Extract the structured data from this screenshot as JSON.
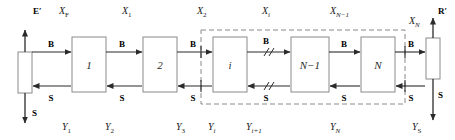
{
  "diagram": {
    "terminals": {
      "left": {
        "top_label": "E′",
        "bottom_label": "S",
        "name": "extract-terminal"
      },
      "right": {
        "top_label": "R′",
        "bottom_label": "S",
        "name": "raffinate-terminal"
      }
    },
    "stages": [
      {
        "id": "stage-1",
        "label": "1",
        "x": 72,
        "y": 37,
        "w": 34,
        "h": 55
      },
      {
        "id": "stage-2",
        "label": "2",
        "x": 143,
        "y": 37,
        "w": 34,
        "h": 55
      },
      {
        "id": "stage-i",
        "label": "i",
        "x": 213,
        "y": 37,
        "w": 34,
        "h": 55
      },
      {
        "id": "stage-n-minus-1",
        "label": "N−1",
        "x": 291,
        "y": 37,
        "w": 38,
        "h": 55
      },
      {
        "id": "stage-n",
        "label": "N",
        "x": 361,
        "y": 37,
        "w": 34,
        "h": 55
      }
    ],
    "top_labels": [
      {
        "name": "x-label-f",
        "base": "X",
        "sub": "F",
        "sub_italic": false,
        "x": 59,
        "y": 14
      },
      {
        "name": "x-label-1",
        "base": "X",
        "sub": "1",
        "sub_italic": false,
        "x": 122,
        "y": 14
      },
      {
        "name": "x-label-2",
        "base": "X",
        "sub": "2",
        "sub_italic": false,
        "x": 197,
        "y": 14
      },
      {
        "name": "x-label-i",
        "base": "X",
        "sub": "i",
        "sub_italic": true,
        "x": 262,
        "y": 14
      },
      {
        "name": "x-label-n-minus-1",
        "base": "X",
        "sub": "N−1",
        "sub_italic": true,
        "x": 330,
        "y": 14
      },
      {
        "name": "x-label-n",
        "base": "X",
        "sub": "N",
        "sub_italic": true,
        "x": 411,
        "y": 22
      }
    ],
    "bottom_labels": [
      {
        "name": "y-label-1",
        "base": "Y",
        "sub": "1",
        "sub_italic": false,
        "x": 62,
        "y": 130
      },
      {
        "name": "y-label-2",
        "base": "Y",
        "sub": "2",
        "sub_italic": false,
        "x": 105,
        "y": 130
      },
      {
        "name": "y-label-3",
        "base": "Y",
        "sub": "3",
        "sub_italic": false,
        "x": 176,
        "y": 130
      },
      {
        "name": "y-label-i",
        "base": "Y",
        "sub": "i",
        "sub_italic": true,
        "x": 208,
        "y": 130
      },
      {
        "name": "y-label-i-plus-1",
        "base": "Y",
        "sub": "i+1",
        "sub_italic": true,
        "x": 248,
        "y": 130
      },
      {
        "name": "y-label-n",
        "base": "Y",
        "sub": "N",
        "sub_italic": true,
        "x": 330,
        "y": 130
      },
      {
        "name": "y-label-s",
        "base": "Y",
        "sub": "S",
        "sub_italic": false,
        "x": 414,
        "y": 130
      }
    ],
    "stream_labels": {
      "top_stream": "B",
      "bottom_stream": "S",
      "b_positions": [
        {
          "name": "b-label-feed",
          "x": 51,
          "y": 44
        },
        {
          "name": "b-label-1",
          "x": 120,
          "y": 44
        },
        {
          "name": "b-label-2",
          "x": 190,
          "y": 44
        },
        {
          "name": "b-label-i",
          "x": 265,
          "y": 44
        },
        {
          "name": "b-label-n-minus-1",
          "x": 340,
          "y": 44
        },
        {
          "name": "b-label-n",
          "x": 411,
          "y": 44
        }
      ],
      "s_positions": [
        {
          "name": "s-label-1",
          "x": 51,
          "y": 96
        },
        {
          "name": "s-label-2",
          "x": 120,
          "y": 96
        },
        {
          "name": "s-label-3",
          "x": 190,
          "y": 96
        },
        {
          "name": "s-label-i",
          "x": 265,
          "y": 96
        },
        {
          "name": "s-label-n-minus-1",
          "x": 340,
          "y": 96
        },
        {
          "name": "s-label-n",
          "x": 411,
          "y": 96
        }
      ]
    },
    "dashed_region": {
      "name": "cascade-envelope",
      "x": 201,
      "y": 30,
      "w": 204,
      "h": 74
    },
    "break_marks": {
      "name": "flow-break-marks",
      "count": 2,
      "top_x": 268,
      "bottom_x": 268
    },
    "colors": {
      "line": "#2b2b2b",
      "box_stroke": "#8a8a8a",
      "dashed_stroke": "#8a8a8a",
      "background": "#ffffff"
    }
  }
}
